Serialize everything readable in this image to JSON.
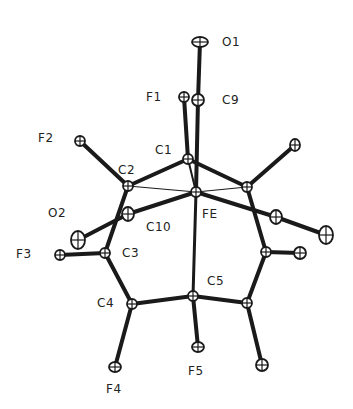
{
  "diagram": {
    "type": "ORTEP molecular structure",
    "atoms": [
      {
        "id": "O1",
        "x": 200,
        "y": 42,
        "rx": 8,
        "ry": 5,
        "label": "O1",
        "lx": 222,
        "ly": 35
      },
      {
        "id": "C9",
        "x": 198,
        "y": 100,
        "rx": 6,
        "ry": 6,
        "label": "C9",
        "lx": 222,
        "ly": 93
      },
      {
        "id": "F1",
        "x": 184,
        "y": 97,
        "rx": 5,
        "ry": 5,
        "label": "F1",
        "lx": 146,
        "ly": 90
      },
      {
        "id": "C1",
        "x": 188,
        "y": 159,
        "rx": 5,
        "ry": 5,
        "label": "C1",
        "lx": 155,
        "ly": 143
      },
      {
        "id": "C2",
        "x": 128,
        "y": 186,
        "rx": 5,
        "ry": 5,
        "label": "C2",
        "lx": 118,
        "ly": 163
      },
      {
        "id": "F2",
        "x": 80,
        "y": 141,
        "rx": 5,
        "ry": 5,
        "label": "F2",
        "lx": 38,
        "ly": 131
      },
      {
        "id": "FE",
        "x": 196,
        "y": 192,
        "rx": 5,
        "ry": 5,
        "label": "FE",
        "lx": 202,
        "ly": 207
      },
      {
        "id": "C10",
        "x": 128,
        "y": 214,
        "rx": 6,
        "ry": 7,
        "label": "C10",
        "lx": 146,
        "ly": 220
      },
      {
        "id": "O2",
        "x": 78,
        "y": 240,
        "rx": 7,
        "ry": 9,
        "label": "O2",
        "lx": 48,
        "ly": 206
      },
      {
        "id": "C3",
        "x": 105,
        "y": 253,
        "rx": 5,
        "ry": 5,
        "label": "C3",
        "lx": 122,
        "ly": 246
      },
      {
        "id": "F3",
        "x": 60,
        "y": 255,
        "rx": 5,
        "ry": 5,
        "label": "F3",
        "lx": 16,
        "ly": 247
      },
      {
        "id": "C4",
        "x": 132,
        "y": 304,
        "rx": 5,
        "ry": 5,
        "label": "C4",
        "lx": 97,
        "ly": 296
      },
      {
        "id": "F4",
        "x": 115,
        "y": 367,
        "rx": 6,
        "ry": 5,
        "label": "F4",
        "lx": 106,
        "ly": 382
      },
      {
        "id": "C5",
        "x": 193,
        "y": 296,
        "rx": 5,
        "ry": 5,
        "label": "C5",
        "lx": 207,
        "ly": 274
      },
      {
        "id": "F5",
        "x": 198,
        "y": 347,
        "rx": 6,
        "ry": 5,
        "label": "F5",
        "lx": 188,
        "ly": 364
      },
      {
        "id": "C2b",
        "x": 247,
        "y": 187,
        "rx": 5,
        "ry": 5,
        "label": "",
        "lx": 0,
        "ly": 0
      },
      {
        "id": "F2b",
        "x": 295,
        "y": 145,
        "rx": 5,
        "ry": 6,
        "label": "",
        "lx": 0,
        "ly": 0
      },
      {
        "id": "C10b",
        "x": 276,
        "y": 217,
        "rx": 6,
        "ry": 7,
        "label": "",
        "lx": 0,
        "ly": 0
      },
      {
        "id": "O2b",
        "x": 326,
        "y": 235,
        "rx": 7,
        "ry": 9,
        "label": "",
        "lx": 0,
        "ly": 0
      },
      {
        "id": "C3b",
        "x": 266,
        "y": 252,
        "rx": 5,
        "ry": 5,
        "label": "",
        "lx": 0,
        "ly": 0
      },
      {
        "id": "F3b",
        "x": 300,
        "y": 253,
        "rx": 6,
        "ry": 6,
        "label": "",
        "lx": 0,
        "ly": 0
      },
      {
        "id": "C4b",
        "x": 247,
        "y": 303,
        "rx": 5,
        "ry": 5,
        "label": "",
        "lx": 0,
        "ly": 0
      },
      {
        "id": "F4b",
        "x": 262,
        "y": 365,
        "rx": 6,
        "ry": 6,
        "label": "",
        "lx": 0,
        "ly": 0
      }
    ],
    "bonds": [
      [
        "O1",
        "C9",
        4
      ],
      [
        "C9",
        "FE",
        4
      ],
      [
        "F1",
        "C1",
        4
      ],
      [
        "C1",
        "FE",
        2
      ],
      [
        "C1",
        "C2",
        4
      ],
      [
        "C1",
        "C2b",
        4
      ],
      [
        "C2",
        "F2",
        4
      ],
      [
        "C2",
        "FE",
        1.2
      ],
      [
        "C2b",
        "FE",
        1.2
      ],
      [
        "C2",
        "C3",
        4
      ],
      [
        "FE",
        "C10",
        4
      ],
      [
        "C10",
        "O2",
        4
      ],
      [
        "C3",
        "F3",
        4
      ],
      [
        "C3",
        "C4",
        4
      ],
      [
        "C4",
        "F4",
        4
      ],
      [
        "C4",
        "C5",
        4
      ],
      [
        "C5",
        "F5",
        4
      ],
      [
        "FE",
        "C5",
        3
      ],
      [
        "C2b",
        "F2b",
        4
      ],
      [
        "FE",
        "C10b",
        4
      ],
      [
        "C10b",
        "O2b",
        4
      ],
      [
        "C2b",
        "C3b",
        4
      ],
      [
        "C3b",
        "F3b",
        4
      ],
      [
        "C3b",
        "C4b",
        4
      ],
      [
        "C4b",
        "F4b",
        4
      ],
      [
        "C5",
        "C4b",
        4
      ]
    ],
    "labels": [
      "O1",
      "C9",
      "F1",
      "C1",
      "C2",
      "F2",
      "FE",
      "C10",
      "O2",
      "C3",
      "F3",
      "C4",
      "F4",
      "C5",
      "F5"
    ]
  }
}
